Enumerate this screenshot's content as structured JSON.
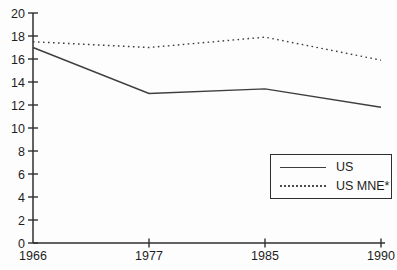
{
  "chart_data": {
    "type": "line",
    "title": "",
    "xlabel": "",
    "ylabel": "",
    "categories": [
      "1966",
      "1977",
      "1985",
      "1990"
    ],
    "series": [
      {
        "name": "US",
        "style": "solid",
        "values": [
          17.0,
          13.0,
          13.4,
          11.8
        ]
      },
      {
        "name": "US MNE*",
        "style": "dotted",
        "values": [
          17.5,
          17.0,
          17.9,
          15.9
        ]
      }
    ],
    "ylim": [
      0,
      20
    ],
    "yticks": [
      0,
      2,
      4,
      6,
      8,
      10,
      12,
      14,
      16,
      18,
      20
    ],
    "grid": false,
    "legend_position": "lower-right",
    "colors": {
      "axis": "#2f2f2f",
      "line": "#3e3e3e",
      "text": "#1d1d1d",
      "background": "#fdfdfd"
    }
  },
  "legend": {
    "items": [
      {
        "label": "US",
        "style": "solid"
      },
      {
        "label": "US MNE*",
        "style": "dotted"
      }
    ]
  }
}
